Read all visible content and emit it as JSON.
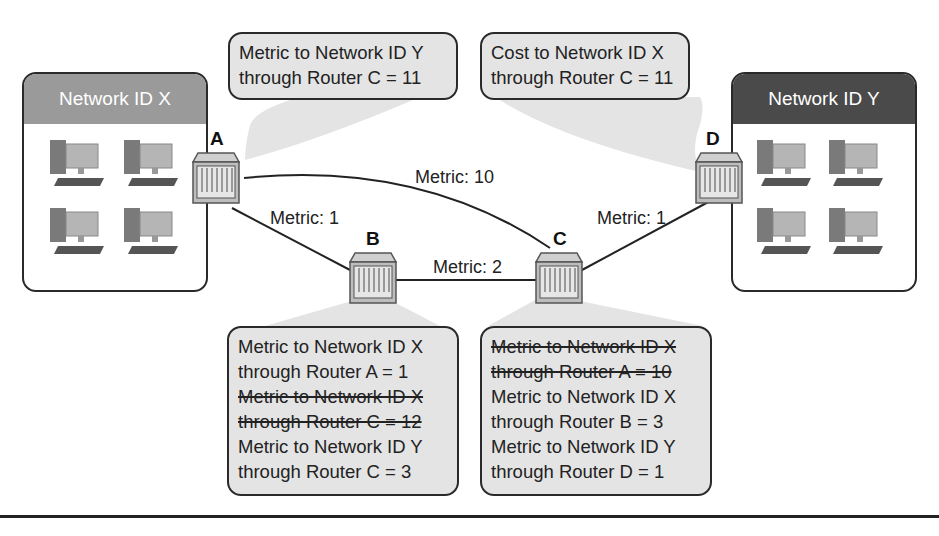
{
  "networks": {
    "x": {
      "label": "Network ID X",
      "header_color": "#9a9a9a",
      "computers": 4
    },
    "y": {
      "label": "Network ID Y",
      "header_color": "#4a4a4a",
      "computers": 4
    }
  },
  "routers": {
    "a": {
      "label": "A"
    },
    "b": {
      "label": "B"
    },
    "c": {
      "label": "C"
    },
    "d": {
      "label": "D"
    }
  },
  "links": {
    "a_c": "Metric: 10",
    "a_b": "Metric: 1",
    "b_c": "Metric: 2",
    "c_d": "Metric: 1"
  },
  "bubbles": {
    "router_a": {
      "lines": [
        {
          "text": "Metric to Network ID Y",
          "struck": false
        },
        {
          "text": "through Router C = 11",
          "struck": false
        }
      ]
    },
    "router_d": {
      "lines": [
        {
          "text": "Cost to Network ID X",
          "struck": false
        },
        {
          "text": "through Router C = 11",
          "struck": false
        }
      ]
    },
    "router_b": {
      "lines": [
        {
          "text": "Metric to Network ID X",
          "struck": false
        },
        {
          "text": "through Router A = 1",
          "struck": false
        },
        {
          "text": "Metric to Network ID X",
          "struck": true
        },
        {
          "text": "through Router C = 12",
          "struck": true
        },
        {
          "text": "Metric to Network ID Y",
          "struck": false
        },
        {
          "text": "through Router C = 3",
          "struck": false
        }
      ]
    },
    "router_c": {
      "lines": [
        {
          "text": "Metric to Network ID X",
          "struck": true
        },
        {
          "text": "through Router A = 10",
          "struck": true
        },
        {
          "text": "Metric to Network ID X",
          "struck": false
        },
        {
          "text": "through Router B = 3",
          "struck": false
        },
        {
          "text": "Metric to Network ID Y",
          "struck": false
        },
        {
          "text": "through Router D = 1",
          "struck": false
        }
      ]
    }
  }
}
